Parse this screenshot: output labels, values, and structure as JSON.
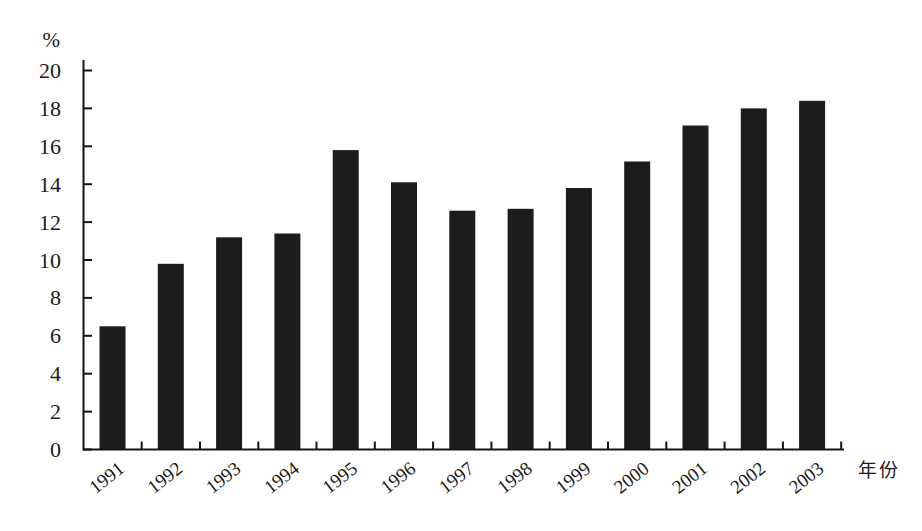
{
  "chart_data": {
    "type": "bar",
    "title": "",
    "ylabel": "%",
    "xlabel": "年份",
    "categories": [
      "1991",
      "1992",
      "1993",
      "1994",
      "1995",
      "1996",
      "1997",
      "1998",
      "1999",
      "2000",
      "2001",
      "2002",
      "2003"
    ],
    "values": [
      6.5,
      9.8,
      11.2,
      11.4,
      15.8,
      14.1,
      12.6,
      12.7,
      13.8,
      15.2,
      17.1,
      18.0,
      18.4
    ],
    "ylim": [
      0,
      20
    ],
    "ytick_step": 2,
    "yticks": [
      0,
      2,
      4,
      6,
      8,
      10,
      12,
      14,
      16,
      18,
      20
    ],
    "grid": false,
    "legend": "none",
    "bar_color": "#1c1c1c",
    "axis_color": "#151515",
    "text_color": "#1a1a1a",
    "background": "#ffffff"
  }
}
